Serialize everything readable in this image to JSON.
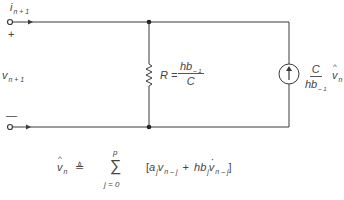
{
  "diagram": {
    "type": "circuit",
    "terminals": {
      "current_label": "i",
      "current_sub": "n + 1",
      "plus": "+",
      "minus": "—",
      "voltage_label": "v",
      "voltage_sub": "n + 1"
    },
    "resistor": {
      "lhs": "R =",
      "num": "hb",
      "num_sub": "– 1",
      "den": "C"
    },
    "current_source": {
      "num": "C",
      "den": "hb",
      "den_sub": "– 1",
      "var": "v",
      "var_sub": "n"
    },
    "formula": {
      "lhs_var": "v",
      "lhs_sub": "n",
      "defeq": "≜",
      "sigma": "∑",
      "upper": "p",
      "lower": "j = 0",
      "open": "[",
      "a": "a",
      "a_sub": "j",
      "v1": "v",
      "v1_sub": "n – j",
      "plus": "+",
      "hb": "hb",
      "hb_sub": "j",
      "v2": "v",
      "v2_sub": "n – j",
      "close": "]"
    },
    "colors": {
      "wire": "#3a3a3a",
      "background": "#ffffff"
    }
  }
}
